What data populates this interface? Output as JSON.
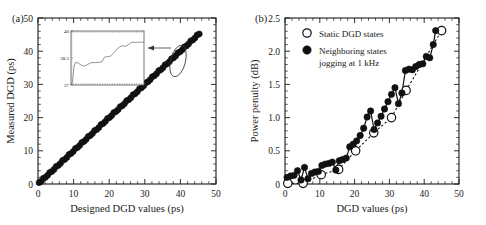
{
  "figure": {
    "panel_a_label": "(a)",
    "panel_b_label": "(b)"
  },
  "chart_data": [
    {
      "id": "panel_a",
      "type": "scatter",
      "title": "",
      "xlabel": "Designed DGD values (ps)",
      "ylabel": "Measured DGD (ps)",
      "xlim": [
        0,
        50
      ],
      "ylim": [
        0,
        50
      ],
      "xticks": [
        0,
        10,
        20,
        30,
        40,
        50
      ],
      "yticks": [
        0,
        10,
        20,
        30,
        40,
        50
      ],
      "grid": false,
      "legend": "none",
      "minor_ticks_per_interval": 5,
      "series": [
        {
          "name": "Measured DGD",
          "marker": "filled-circle",
          "x": [
            0.3,
            0.9,
            1.5,
            2.1,
            2.7,
            3.3,
            3.9,
            4.5,
            5.1,
            5.7,
            6.3,
            6.9,
            7.5,
            8.1,
            8.7,
            9.3,
            9.9,
            10.5,
            11.1,
            11.7,
            12.3,
            12.9,
            13.5,
            14.1,
            14.7,
            15.3,
            15.9,
            16.5,
            17.1,
            17.7,
            18.3,
            18.9,
            19.5,
            20.1,
            20.7,
            21.3,
            21.9,
            22.5,
            23.1,
            23.7,
            24.3,
            24.9,
            25.5,
            26.1,
            26.7,
            27.3,
            27.9,
            28.5,
            29.1,
            29.7,
            30.3,
            30.9,
            31.5,
            32.1,
            32.7,
            33.3,
            33.9,
            34.5,
            35.1,
            35.7,
            36.3,
            36.9,
            37.5,
            38.1,
            38.7,
            39.3,
            39.9,
            40.5,
            41.1,
            41.7,
            42.3,
            42.9,
            43.5,
            44.1,
            44.7,
            45.3
          ],
          "y": [
            0.4,
            0.8,
            1.7,
            2.0,
            2.6,
            3.5,
            3.8,
            4.4,
            5.3,
            5.6,
            6.2,
            7.1,
            7.4,
            8.0,
            8.9,
            9.2,
            9.8,
            10.7,
            11.0,
            11.6,
            12.5,
            12.8,
            13.4,
            14.3,
            14.6,
            15.2,
            16.1,
            16.4,
            17.0,
            17.9,
            18.2,
            18.8,
            19.7,
            20.0,
            20.6,
            21.5,
            21.8,
            22.4,
            23.3,
            23.6,
            24.2,
            25.1,
            25.4,
            26.0,
            26.9,
            27.2,
            27.8,
            28.7,
            29.0,
            29.6,
            30.5,
            30.8,
            31.4,
            32.3,
            32.6,
            33.2,
            34.1,
            34.4,
            35.0,
            35.9,
            36.2,
            36.8,
            37.7,
            38.0,
            38.6,
            39.5,
            39.8,
            40.4,
            41.3,
            41.6,
            42.2,
            43.1,
            43.4,
            44.0,
            44.9,
            45.2
          ]
        }
      ],
      "inset": {
        "ylim": [
          37,
          40
        ],
        "yticks": [
          37,
          38.5,
          40
        ],
        "ytick_labels": [
          "37",
          "38.5",
          "40"
        ],
        "trace_description": "staircase-like rising detail of DGD fine steps",
        "x": [
          0.0,
          0.02,
          0.04,
          0.06,
          0.1,
          0.14,
          0.18,
          0.22,
          0.26,
          0.3,
          0.34,
          0.38,
          0.42,
          0.46,
          0.5,
          0.54,
          0.58,
          0.62,
          0.66,
          0.7,
          0.74,
          0.78,
          0.82,
          0.86,
          0.9,
          0.94,
          1.0
        ],
        "y": [
          37.05,
          37.1,
          38.0,
          38.25,
          38.22,
          38.1,
          38.05,
          38.12,
          38.22,
          38.25,
          38.24,
          38.26,
          38.28,
          38.55,
          38.58,
          38.6,
          38.75,
          38.95,
          39.1,
          39.18,
          39.15,
          39.22,
          39.35,
          39.38,
          39.36,
          39.38,
          39.38
        ]
      },
      "annotation": {
        "ellipse": "highlight ellipse around data near 37-39 ps",
        "arrow": "arrow from ellipse to inset"
      }
    },
    {
      "id": "panel_b",
      "type": "line",
      "title": "",
      "xlabel": "DGD values (ps)",
      "ylabel": "Power penulty (dB)",
      "xlim": [
        0,
        50
      ],
      "ylim": [
        0,
        2.5
      ],
      "xticks": [
        0,
        10,
        20,
        30,
        40,
        50
      ],
      "yticks": [
        0,
        0.5,
        1.0,
        1.5,
        2.0,
        2.5
      ],
      "ytick_labels": [
        "0",
        "0.5",
        "1.0",
        "1.5",
        "2.0",
        "2.5"
      ],
      "grid": false,
      "legend_position": "top-left",
      "minor_ticks_per_interval": 5,
      "series": [
        {
          "name": "Static DGD states",
          "marker": "open-circle",
          "line": "dashed",
          "x": [
            0.8,
            5.2,
            10.4,
            15.4,
            20.3,
            25.5,
            30.6,
            34.8,
            45.0
          ],
          "y": [
            0.01,
            0.01,
            0.14,
            0.22,
            0.5,
            0.77,
            1.0,
            1.41,
            2.31
          ]
        },
        {
          "name": "Neighboring states jogging at 1 kHz",
          "marker": "filled-circle",
          "line": "solid",
          "x": [
            0.6,
            1.6,
            2.6,
            3.6,
            4.6,
            5.6,
            6.6,
            7.6,
            8.6,
            9.6,
            10.6,
            11.6,
            12.6,
            13.6,
            14.6,
            15.6,
            16.6,
            17.6,
            18.6,
            19.6,
            20.6,
            21.6,
            22.6,
            23.6,
            24.6,
            25.6,
            26.6,
            27.6,
            28.6,
            29.6,
            30.6,
            31.6,
            32.6,
            33.6,
            34.6,
            35.6,
            36.6,
            37.6,
            38.6,
            39.6,
            40.6,
            41.6,
            42.6,
            43.3
          ],
          "y": [
            0.1,
            0.12,
            0.13,
            0.2,
            0.06,
            0.25,
            0.08,
            0.16,
            0.18,
            0.19,
            0.28,
            0.3,
            0.31,
            0.33,
            0.21,
            0.35,
            0.37,
            0.39,
            0.56,
            0.6,
            0.65,
            0.73,
            0.84,
            1.01,
            1.1,
            0.82,
            0.92,
            1.02,
            1.13,
            1.24,
            1.35,
            1.45,
            1.21,
            1.37,
            1.71,
            1.73,
            1.72,
            1.77,
            1.8,
            1.81,
            1.92,
            1.9,
            2.1,
            2.31
          ]
        }
      ]
    }
  ]
}
